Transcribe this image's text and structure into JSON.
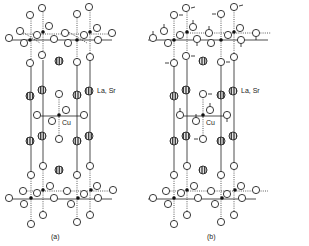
{
  "figure": {
    "panels": [
      {
        "id": "a",
        "caption": "(a)",
        "caption_pos": [
          55,
          238
        ],
        "offset": [
          0,
          0
        ],
        "show_arrows": false
      },
      {
        "id": "b",
        "caption": "(b)",
        "caption_pos": [
          211,
          238
        ],
        "offset": [
          156,
          0
        ],
        "show_arrows": true
      }
    ],
    "labels": {
      "la_sr": "La, Sr",
      "cu": "Cu"
    },
    "colors": {
      "line": "#222222",
      "background": "#ffffff",
      "hatch": "#222222"
    },
    "legend": [
      {
        "symbol": "open-circle",
        "meaning": "O"
      },
      {
        "symbol": "hatched-circle",
        "meaning": "La, Sr"
      },
      {
        "symbol": "filled-dot",
        "meaning": "Cu"
      }
    ]
  }
}
